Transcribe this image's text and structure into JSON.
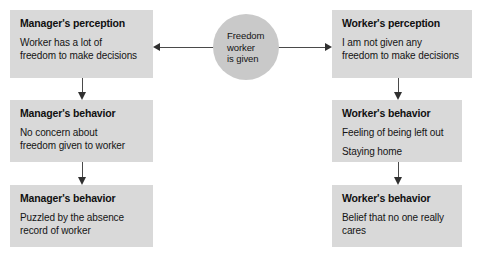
{
  "diagram": {
    "center_node": {
      "label_lines": [
        "Freedom",
        "worker",
        "is given"
      ]
    },
    "left_column": [
      {
        "title": "Manager's perception",
        "lines": [
          "Worker has a lot of",
          "freedom to make decisions"
        ]
      },
      {
        "title": "Manager's behavior",
        "lines": [
          "No concern about",
          "freedom given to worker"
        ]
      },
      {
        "title": "Manager's behavior",
        "lines": [
          "Puzzled by the absence",
          "record of worker"
        ]
      }
    ],
    "right_column": [
      {
        "title": "Worker's perception",
        "lines": [
          "I am not given any",
          "freedom to make decisions"
        ]
      },
      {
        "title": "Worker's behavior",
        "lines": [
          "Feeling of being left out",
          "Staying home"
        ]
      },
      {
        "title": "Worker's behavior",
        "lines": [
          "Belief that no one really",
          "cares"
        ]
      }
    ],
    "colors": {
      "box_fill": "#d9d9d9",
      "circle_fill": "#c9c9c9",
      "connector": "#4a4a4a",
      "text": "#141414",
      "background": "#ffffff"
    }
  }
}
